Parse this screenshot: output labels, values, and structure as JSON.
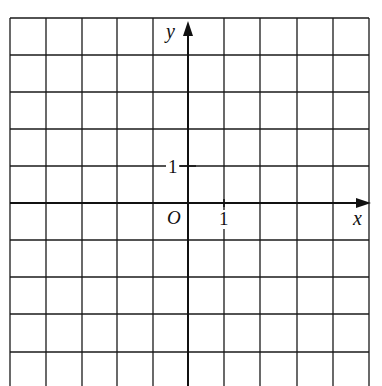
{
  "diagram": {
    "type": "coordinate-grid",
    "x_axis_label": "x",
    "y_axis_label": "y",
    "origin_label": "O",
    "x_tick_label": "1",
    "y_tick_label": "1",
    "grid": {
      "columns_left_of_y_axis": 5,
      "columns_right_of_y_axis": 5,
      "rows_above_x_axis": 5,
      "rows_below_x_axis_visible": 5,
      "unit": 1
    },
    "colors": {
      "line": "#111111",
      "background": "#ffffff"
    }
  }
}
